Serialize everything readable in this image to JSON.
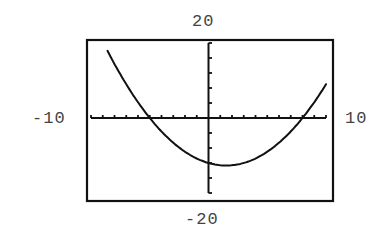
{
  "chart_data": {
    "type": "line",
    "title": "",
    "xlabel": "",
    "ylabel": "",
    "window": {
      "xmin": -10,
      "xmax": 10,
      "ymin": -20,
      "ymax": 20,
      "xscl": 1,
      "yscl": 4
    },
    "window_labels": {
      "ymax": "20",
      "ymin": "-20",
      "xmin": "-10",
      "xmax": "10"
    },
    "grid": false,
    "legend": null,
    "series": [
      {
        "name": "parabola",
        "equation": "y = 0.3x^2 - 0.9x - 12",
        "x": [
          -8.6,
          -8,
          -7,
          -6,
          -5,
          -4,
          -3,
          -2,
          -1,
          0,
          1,
          1.5,
          2,
          3,
          4,
          5,
          6,
          7,
          8,
          9,
          10
        ],
        "y": [
          18.9,
          14.4,
          9.0,
          3.6,
          0,
          -3.6,
          -6.6,
          -9.0,
          -10.8,
          -12.0,
          -12.6,
          -12.68,
          -12.6,
          -12.0,
          -10.8,
          -9.0,
          -6.6,
          -3.6,
          0,
          4.2,
          9.0
        ]
      }
    ],
    "x_intercepts": [
      -5,
      8
    ],
    "y_intercept": -12,
    "vertex": [
      1.5,
      -12.68
    ]
  },
  "style": {
    "ink": "#111111",
    "label_color": "#444444",
    "background": "#ffffff"
  }
}
